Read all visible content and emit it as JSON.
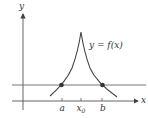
{
  "diagram": {
    "axes": {
      "x_label": "x",
      "y_label": "y"
    },
    "curve_label": "y = f(x)",
    "tick_labels": {
      "a": "a",
      "x0_base": "x",
      "x0_sub": "0",
      "b": "b"
    },
    "colors": {
      "axis": "#555555",
      "curve": "#444444",
      "horizontal_line": "#666666",
      "points": "#333333"
    }
  }
}
